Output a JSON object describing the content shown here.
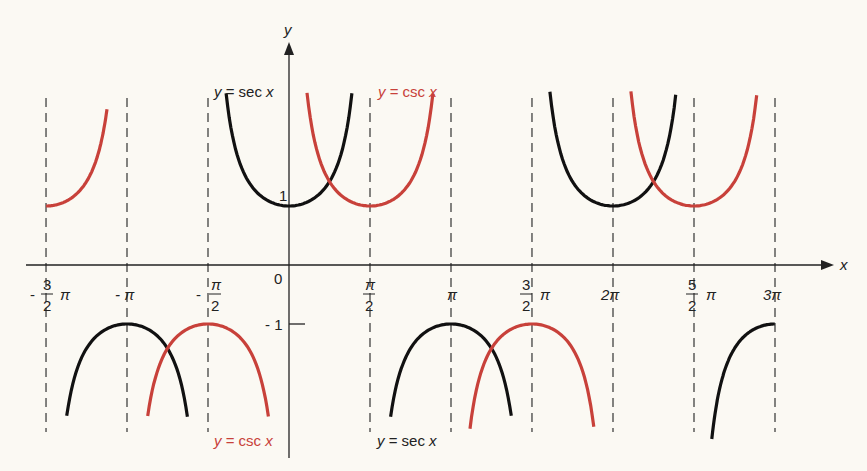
{
  "chart_data": {
    "type": "line",
    "title": "",
    "xlabel": "x",
    "ylabel": "y",
    "xlim": [
      -4.96,
      9.81
    ],
    "ylim": [
      -3.27,
      3.0
    ],
    "grid": false,
    "asymptotes_x": [
      "-3π/2",
      "-π",
      "-π/2",
      "π/2",
      "π",
      "3π/2",
      "2π",
      "5π/2",
      "3π"
    ],
    "x_ticks": [
      {
        "value": -4.712,
        "label_num": "3",
        "label_den": "2",
        "label": "-3/2 π",
        "prefix": "-",
        "suffix": "π",
        "type": "frac"
      },
      {
        "value": -3.1416,
        "label": "-π",
        "type": "plain"
      },
      {
        "value": -1.5708,
        "label_num": "π",
        "label_den": "2",
        "label": "-π/2",
        "prefix": "-",
        "type": "frac"
      },
      {
        "value": 0,
        "label": "0",
        "type": "origin"
      },
      {
        "value": 1.5708,
        "label_num": "π",
        "label_den": "2",
        "label": "π/2",
        "prefix": "",
        "type": "frac"
      },
      {
        "value": 3.1416,
        "label": "π",
        "type": "plain"
      },
      {
        "value": 4.712,
        "label_num": "3",
        "label_den": "2",
        "label": "3/2 π",
        "prefix": "",
        "suffix": "π",
        "type": "frac"
      },
      {
        "value": 6.2832,
        "label": "2π",
        "type": "plain"
      },
      {
        "value": 7.854,
        "label_num": "5",
        "label_den": "2",
        "label": "5/2 π",
        "prefix": "",
        "suffix": "π",
        "type": "frac"
      },
      {
        "value": 9.4248,
        "label": "3π",
        "type": "plain"
      }
    ],
    "y_ticks": [
      {
        "value": 1,
        "label": "1"
      },
      {
        "value": -1,
        "label": "-1"
      }
    ],
    "series": [
      {
        "name": "y = sec x",
        "color": "#111111",
        "function": "sec",
        "branches": [
          [
            -4.31,
            -1.97
          ],
          [
            -1.22,
            1.22
          ],
          [
            1.97,
            4.31
          ],
          [
            5.06,
            7.5
          ],
          [
            8.2,
            9.42
          ]
        ]
      },
      {
        "name": "y = csc x",
        "color": "#c8413a",
        "function": "csc",
        "branches": [
          [
            -4.71,
            -3.53
          ],
          [
            -2.74,
            -0.4
          ],
          [
            0.35,
            2.79
          ],
          [
            3.51,
            5.91
          ],
          [
            6.63,
            9.07
          ]
        ]
      }
    ],
    "annotations": [
      {
        "text": "y = sec x",
        "color": "#111111",
        "position": "upper-left of y-axis"
      },
      {
        "text": "y = csc x",
        "color": "#c8413a",
        "position": "upper-right of y-axis"
      },
      {
        "text": "y = csc x",
        "color": "#c8413a",
        "position": "lower-left of y-axis"
      },
      {
        "text": "y = sec x",
        "color": "#111111",
        "position": "lower, near π/2"
      }
    ]
  },
  "labels": {
    "x_axis": "x",
    "y_axis": "y",
    "origin": "0",
    "y_one": "1",
    "y_neg_one": "- 1",
    "sec_label_prefix": "y",
    "sec_label_text": " = sec ",
    "sec_label_var": "x",
    "csc_label_prefix": "y",
    "csc_label_text": " = csc ",
    "csc_label_var": "x",
    "pi": "π",
    "minus": "-",
    "neg_pi": "- π",
    "two_pi": "2π",
    "three_pi": "3π",
    "n3": "3",
    "n5": "5",
    "d2": "2"
  }
}
